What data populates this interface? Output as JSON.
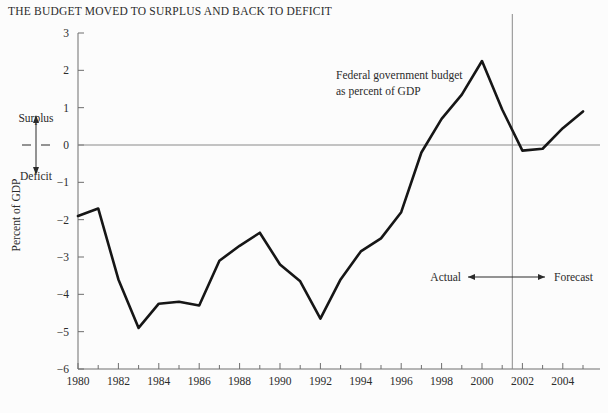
{
  "title": "THE BUDGET MOVED TO SURPLUS AND BACK TO DEFICIT",
  "annotations": {
    "series_label_line1": "Federal government budget",
    "series_label_line2": "as percent of GDP",
    "surplus": "Surplus",
    "deficit": "Deficit",
    "actual": "Actual",
    "forecast": "Forecast"
  },
  "chart_data": {
    "type": "line",
    "title": "THE BUDGET MOVED TO SURPLUS AND BACK TO DEFICIT",
    "xlabel": "",
    "ylabel": "Percent of GDP",
    "xlim": [
      1980,
      2005
    ],
    "ylim": [
      -6,
      3
    ],
    "grid": false,
    "legend_position": "inline-annotation",
    "series": [
      {
        "name": "Federal government budget as percent of GDP",
        "x": [
          1980,
          1981,
          1982,
          1983,
          1984,
          1985,
          1986,
          1987,
          1988,
          1989,
          1990,
          1991,
          1992,
          1993,
          1994,
          1995,
          1996,
          1997,
          1998,
          1999,
          2000,
          2001,
          2002,
          2003,
          2004,
          2005
        ],
        "values": [
          -1.9,
          -1.7,
          -3.6,
          -4.9,
          -4.25,
          -4.2,
          -4.3,
          -3.1,
          -2.7,
          -2.35,
          -3.2,
          -3.65,
          -4.65,
          -3.6,
          -2.85,
          -2.5,
          -1.8,
          -0.2,
          0.7,
          1.35,
          2.25,
          0.95,
          -0.15,
          -0.1,
          0.45,
          0.9
        ]
      }
    ],
    "y_ticks": [
      3,
      2,
      1,
      0,
      -1,
      -2,
      -3,
      -4,
      -5,
      -6
    ],
    "y_tick_labels": [
      "3",
      "2",
      "1",
      "0",
      "−1",
      "−2",
      "−3",
      "−4",
      "−5",
      "−6"
    ],
    "x_ticks_major": [
      1980,
      1982,
      1984,
      1986,
      1988,
      1990,
      1992,
      1994,
      1996,
      1998,
      2000,
      2002,
      2004
    ],
    "x_tick_labels": [
      "1980",
      "1982",
      "1984",
      "1986",
      "1988",
      "1990",
      "1992",
      "1994",
      "1996",
      "1998",
      "2000",
      "2002",
      "2004"
    ],
    "x_ticks_minor": [
      1981,
      1983,
      1985,
      1987,
      1989,
      1991,
      1993,
      1995,
      1997,
      1999,
      2001,
      2003,
      2005
    ],
    "zero_reference_line": 0,
    "divider_x": 2001.5,
    "divider_label_left": "Actual",
    "divider_label_right": "Forecast",
    "line_color": "#161616",
    "axis_color": "#6e6e6e",
    "background_color": "#fcfcfc"
  }
}
